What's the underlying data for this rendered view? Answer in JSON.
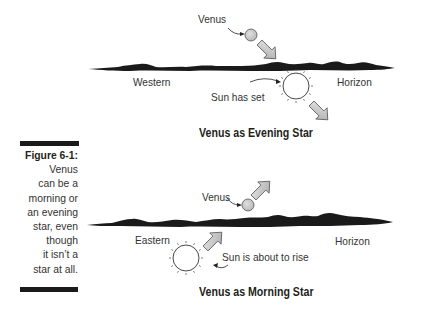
{
  "figure": {
    "number_label": "Figure 6-1:",
    "caption_lines": [
      "Venus",
      "can be a",
      "morning or",
      "an evening",
      "star, even",
      "though",
      "it isn’t a",
      "star at all."
    ]
  },
  "evening_panel": {
    "title": "Venus as Evening Star",
    "venus_label": "Venus",
    "sun_label": "Sun has set",
    "horizon_left_label": "Western",
    "horizon_right_label": "Horizon",
    "venus_motion": "down-right",
    "sun_motion": "down-right"
  },
  "morning_panel": {
    "title": "Venus as Morning Star",
    "venus_label": "Venus",
    "sun_label": "Sun is about to rise",
    "horizon_left_label": "Eastern",
    "horizon_right_label": "Horizon",
    "venus_motion": "up-right",
    "sun_motion": "up-right"
  },
  "colors": {
    "ink": "#1a1a1a",
    "venus_fill": "#c8c8c8",
    "arrow_fill": "#cfcfcf",
    "text": "#333333"
  }
}
